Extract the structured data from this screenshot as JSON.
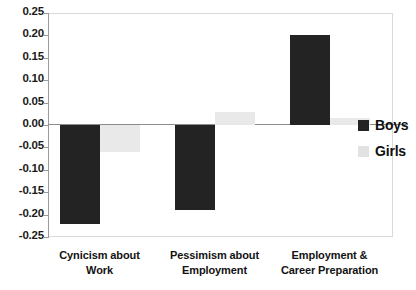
{
  "chart_data": {
    "type": "bar",
    "title": "",
    "subtitle": "",
    "xlabel": "",
    "ylabel": "",
    "ylim": [
      -0.25,
      0.25
    ],
    "grid": false,
    "legend_position": "right",
    "categories": [
      "Cynicism about Work",
      "Pessimism about Employment",
      "Employment & Career Preparation"
    ],
    "category_lines": [
      [
        "Cynicism about",
        "Work"
      ],
      [
        "Pessimism about",
        "Employment"
      ],
      [
        "Employment &",
        "Career Preparation"
      ]
    ],
    "series": [
      {
        "name": "Boys",
        "color": "#232323",
        "values": [
          -0.22,
          -0.19,
          0.2
        ]
      },
      {
        "name": "Girls",
        "color": "#e9e9e9",
        "values": [
          -0.06,
          0.03,
          0.015
        ]
      }
    ],
    "ytick_labels": [
      "0.25",
      "0.20",
      "0.15",
      "0.10",
      "0.05",
      "0.00",
      "-0.05",
      "-0.10",
      "-0.15",
      "-0.20",
      "-0.25"
    ],
    "ytick_values": [
      0.25,
      0.2,
      0.15,
      0.1,
      0.05,
      0.0,
      -0.05,
      -0.1,
      -0.15,
      -0.2,
      -0.25
    ]
  },
  "legend": {
    "items": [
      {
        "label": "Boys",
        "swatch": "boys-swatch"
      },
      {
        "label": "Girls",
        "swatch": "girls-swatch"
      }
    ]
  },
  "colors": {
    "boys": "#232323",
    "girls": "#e9e9e9",
    "axis": "#9a9a9a",
    "zero_line": "#8d8d8d",
    "plot_border": "#d9d9d9",
    "text": "#121212",
    "background": "#ffffff"
  }
}
